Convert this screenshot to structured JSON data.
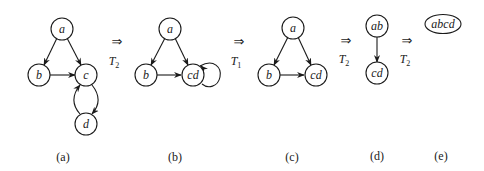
{
  "figure": {
    "panels": [
      {
        "id": "a",
        "caption": "(a)",
        "nodes": [
          {
            "id": "a",
            "label": "a"
          },
          {
            "id": "b",
            "label": "b"
          },
          {
            "id": "c",
            "label": "c"
          },
          {
            "id": "d",
            "label": "d"
          }
        ],
        "edges": [
          [
            "a",
            "b"
          ],
          [
            "a",
            "c"
          ],
          [
            "b",
            "c"
          ],
          [
            "c",
            "d"
          ],
          [
            "d",
            "c"
          ]
        ]
      },
      {
        "id": "b",
        "caption": "(b)",
        "nodes": [
          {
            "id": "a",
            "label": "a"
          },
          {
            "id": "b",
            "label": "b"
          },
          {
            "id": "cd",
            "label": "cd"
          }
        ],
        "edges": [
          [
            "a",
            "b"
          ],
          [
            "a",
            "cd"
          ],
          [
            "b",
            "cd"
          ],
          [
            "cd",
            "cd"
          ]
        ]
      },
      {
        "id": "c",
        "caption": "(c)",
        "nodes": [
          {
            "id": "a",
            "label": "a"
          },
          {
            "id": "b",
            "label": "b"
          },
          {
            "id": "cd",
            "label": "cd"
          }
        ],
        "edges": [
          [
            "a",
            "b"
          ],
          [
            "a",
            "cd"
          ],
          [
            "b",
            "cd"
          ]
        ]
      },
      {
        "id": "d",
        "caption": "(d)",
        "nodes": [
          {
            "id": "ab",
            "label": "ab"
          },
          {
            "id": "cd",
            "label": "cd"
          }
        ],
        "edges": [
          [
            "ab",
            "cd"
          ]
        ]
      },
      {
        "id": "e",
        "caption": "(e)",
        "nodes": [
          {
            "id": "abcd",
            "label": "abcd"
          }
        ],
        "edges": []
      }
    ],
    "transforms": [
      {
        "arrow": "⇒",
        "name": "T",
        "subscript": "2"
      },
      {
        "arrow": "⇒",
        "name": "T",
        "subscript": "1"
      },
      {
        "arrow": "⇒",
        "name": "T",
        "subscript": "2"
      },
      {
        "arrow": "⇒",
        "name": "T",
        "subscript": "2"
      }
    ]
  }
}
